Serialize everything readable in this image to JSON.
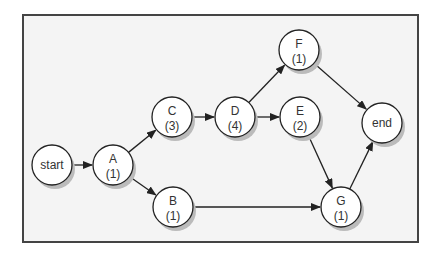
{
  "diagram": {
    "type": "activity-network",
    "nodes": [
      {
        "id": "start",
        "label": "start",
        "duration": null,
        "x": 52,
        "y": 165
      },
      {
        "id": "A",
        "label": "A",
        "duration": "(1)",
        "x": 113,
        "y": 165
      },
      {
        "id": "B",
        "label": "B",
        "duration": "(1)",
        "x": 173,
        "y": 207
      },
      {
        "id": "C",
        "label": "C",
        "duration": "(3)",
        "x": 172,
        "y": 117
      },
      {
        "id": "D",
        "label": "D",
        "duration": "(4)",
        "x": 235,
        "y": 117
      },
      {
        "id": "E",
        "label": "E",
        "duration": "(2)",
        "x": 300,
        "y": 117
      },
      {
        "id": "F",
        "label": "F",
        "duration": "(1)",
        "x": 299,
        "y": 50
      },
      {
        "id": "end",
        "label": "end",
        "duration": null,
        "x": 382,
        "y": 123
      },
      {
        "id": "G",
        "label": "G",
        "duration": "(1)",
        "x": 341,
        "y": 207
      }
    ],
    "edges": [
      [
        "start",
        "A"
      ],
      [
        "A",
        "C"
      ],
      [
        "A",
        "B"
      ],
      [
        "C",
        "D"
      ],
      [
        "D",
        "F"
      ],
      [
        "D",
        "E"
      ],
      [
        "F",
        "end"
      ],
      [
        "E",
        "G"
      ],
      [
        "B",
        "G"
      ],
      [
        "G",
        "end"
      ]
    ],
    "colors": {
      "frame": "#444444",
      "background": "#f4f4f4",
      "node_fill": "#ffffff",
      "stroke": "#222222",
      "shadow": "#bbbbbb"
    }
  }
}
